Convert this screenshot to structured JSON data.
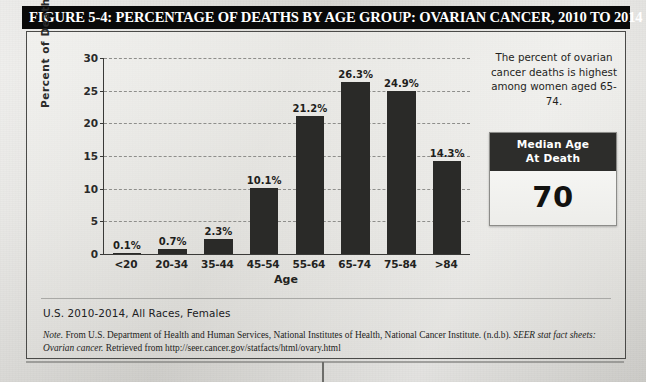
{
  "figure": {
    "title": "FIGURE 5-4: PERCENTAGE OF DEATHS BY AGE GROUP: OVARIAN CANCER, 2010 TO 2014",
    "source_line": "U.S. 2010-2014, All Races, Females",
    "note_prefix": "Note.",
    "note_part1": " From U.S. Department of Health and Human Services, National Institutes of Health, National Cancer Institute. (n.d.b). ",
    "note_italic1": "SEER stat fact sheets: Ovarian cancer.",
    "note_part2": " Retrieved from http://seer.cancer.gov/statfacts/html/ovary.html"
  },
  "side_panel": {
    "callout": "The percent of ovarian cancer deaths is highest among women aged 65-74.",
    "median_label_line1": "Median Age",
    "median_label_line2": "At Death",
    "median_value": "70"
  },
  "colors": {
    "bar": "#2a2a28",
    "title_bar_bg": "#090909",
    "title_bar_text": "#ffffff",
    "axis": "#3a3a38",
    "gridline": "#8e8e8b"
  },
  "chart_data": {
    "type": "bar",
    "title": "FIGURE 5-4: PERCENTAGE OF DEATHS BY AGE GROUP: OVARIAN CANCER, 2010 TO 2014",
    "xlabel": "Age",
    "ylabel": "Percent of Deaths",
    "ylim": [
      0,
      30
    ],
    "yticks": [
      0,
      5,
      10,
      15,
      20,
      25,
      30
    ],
    "grid": true,
    "legend": false,
    "categories": [
      "<20",
      "20-34",
      "35-44",
      "45-54",
      "55-64",
      "65-74",
      "75-84",
      ">84"
    ],
    "values": [
      0.1,
      0.7,
      2.3,
      10.1,
      21.2,
      26.3,
      24.9,
      14.3
    ],
    "data_labels": [
      "0.1%",
      "0.7%",
      "2.3%",
      "10.1%",
      "21.2%",
      "26.3%",
      "24.9%",
      "14.3%"
    ]
  }
}
